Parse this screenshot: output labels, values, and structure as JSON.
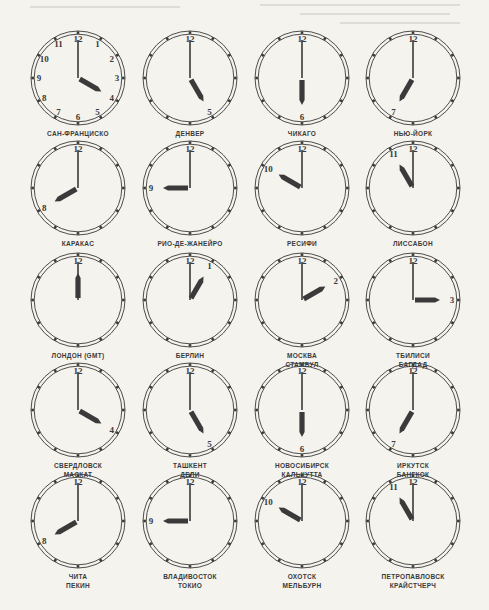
{
  "page": {
    "ink_color": "#3a3a3a",
    "paper_color": "#f4f3ee"
  },
  "clocks": [
    {
      "labels": [
        "САН-ФРАНЦИСКО"
      ],
      "hour": 4,
      "minute": 0,
      "numerals": "all"
    },
    {
      "labels": [
        "ДЕНВЕР"
      ],
      "hour": 5,
      "minute": 0,
      "numerals": [
        12,
        5
      ]
    },
    {
      "labels": [
        "ЧИКАГО"
      ],
      "hour": 6,
      "minute": 0,
      "numerals": [
        12,
        6
      ]
    },
    {
      "labels": [
        "НЬЮ-ЙОРК"
      ],
      "hour": 7,
      "minute": 0,
      "numerals": [
        12,
        7
      ]
    },
    {
      "labels": [
        "КАРАКАС"
      ],
      "hour": 8,
      "minute": 0,
      "numerals": [
        12,
        8
      ]
    },
    {
      "labels": [
        "РИО-ДЕ-ЖАНЕЙРО"
      ],
      "hour": 9,
      "minute": 0,
      "numerals": [
        12,
        9
      ]
    },
    {
      "labels": [
        "РЕСИФИ"
      ],
      "hour": 10,
      "minute": 0,
      "numerals": [
        12,
        10
      ]
    },
    {
      "labels": [
        "ЛИССАБОН"
      ],
      "hour": 11,
      "minute": 0,
      "numerals": [
        12,
        11
      ]
    },
    {
      "labels": [
        "ЛОНДОН (GMT)"
      ],
      "hour": 12,
      "minute": 0,
      "numerals": [
        12
      ]
    },
    {
      "labels": [
        "БЕРЛИН"
      ],
      "hour": 1,
      "minute": 0,
      "numerals": [
        12,
        1
      ]
    },
    {
      "labels": [
        "МОСКВА",
        "СТАМБУЛ"
      ],
      "hour": 2,
      "minute": 0,
      "numerals": [
        12,
        2
      ]
    },
    {
      "labels": [
        "ТБИЛИСИ",
        "БАГДАД"
      ],
      "hour": 3,
      "minute": 0,
      "numerals": [
        12,
        3
      ]
    },
    {
      "labels": [
        "СВЕРДЛОВСК",
        "МАСКАТ"
      ],
      "hour": 4,
      "minute": 0,
      "numerals": [
        12,
        4
      ]
    },
    {
      "labels": [
        "ТАШКЕНТ",
        "ДЕЛИ"
      ],
      "hour": 5,
      "minute": 0,
      "numerals": [
        12,
        5
      ]
    },
    {
      "labels": [
        "НОВОСИБИРСК",
        "КАЛЬКУТТА"
      ],
      "hour": 6,
      "minute": 0,
      "numerals": [
        12,
        6
      ]
    },
    {
      "labels": [
        "ИРКУТСК",
        "БАНГКОК"
      ],
      "hour": 7,
      "minute": 0,
      "numerals": [
        12,
        7
      ]
    },
    {
      "labels": [
        "ЧИТА",
        "ПЕКИН"
      ],
      "hour": 8,
      "minute": 0,
      "numerals": [
        12,
        8
      ]
    },
    {
      "labels": [
        "ВЛАДИВОСТОК",
        "ТОКИО"
      ],
      "hour": 9,
      "minute": 0,
      "numerals": [
        12,
        9
      ]
    },
    {
      "labels": [
        "ОХОТСК",
        "МЕЛЬБУРН"
      ],
      "hour": 10,
      "minute": 0,
      "numerals": [
        12,
        10
      ]
    },
    {
      "labels": [
        "ПЕТРОПАВЛОВСК",
        "КРАЙСТЧЕРЧ"
      ],
      "hour": 11,
      "minute": 0,
      "numerals": [
        12,
        11
      ]
    }
  ]
}
